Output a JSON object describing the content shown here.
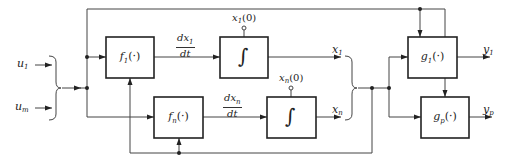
{
  "diagram": {
    "type": "block-diagram",
    "inputs": [
      {
        "id": "u1",
        "symbol": "u",
        "sub": "1"
      },
      {
        "id": "um",
        "symbol": "u",
        "sub": "m"
      }
    ],
    "blocks": {
      "f1": {
        "func": "f",
        "sub": "1",
        "arg": "(·)"
      },
      "fn": {
        "func": "f",
        "sub": "n",
        "arg": "(·)"
      },
      "int1": {
        "glyph": "∫",
        "init": "x",
        "init_sub": "1",
        "init_arg": "(0)"
      },
      "intn": {
        "glyph": "∫",
        "init": "x",
        "init_sub": "n",
        "init_arg": "(0)"
      },
      "g1": {
        "func": "g",
        "sub": "1",
        "arg": "(·)"
      },
      "gp": {
        "func": "g",
        "sub": "p",
        "arg": "(·)"
      }
    },
    "derivatives": [
      {
        "num": "dx",
        "num_sub": "1",
        "den": "dt"
      },
      {
        "num": "dx",
        "num_sub": "n",
        "den": "dt"
      }
    ],
    "states": [
      {
        "symbol": "x",
        "sub": "1"
      },
      {
        "symbol": "x",
        "sub": "n"
      }
    ],
    "outputs": [
      {
        "symbol": "y",
        "sub": "1"
      },
      {
        "symbol": "y",
        "sub": "p"
      }
    ],
    "colors": {
      "stroke": "#333333",
      "thick": "#222222",
      "background": "#ffffff"
    }
  }
}
